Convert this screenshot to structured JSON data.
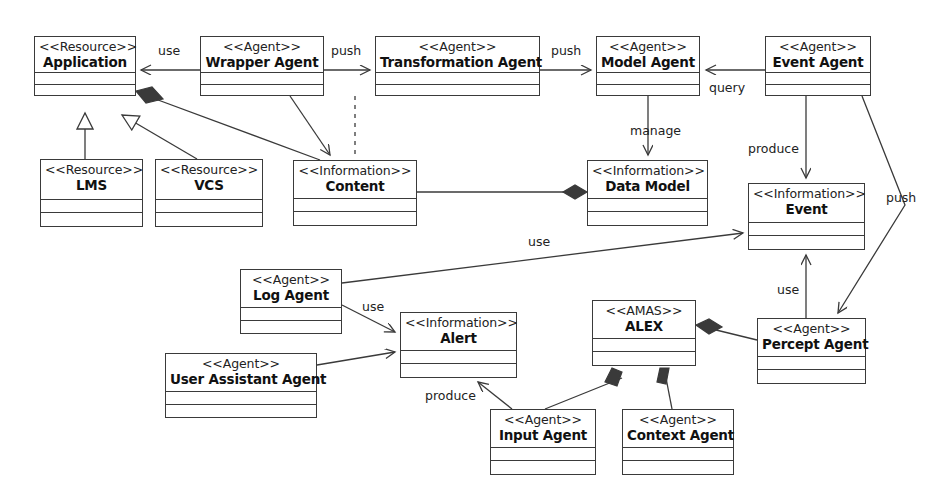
{
  "diagram": {
    "canvas": {
      "width": 942,
      "height": 504
    },
    "line_color": "#3a3a3a",
    "fill_color": "#ffffff",
    "text_color": "#111111"
  },
  "nodes": [
    {
      "id": "application",
      "stereotype": "<<Resource>>",
      "name": "Application",
      "x": 34,
      "y": 36,
      "w": 102,
      "h": 60,
      "header_h": 36,
      "attrs_h": 12
    },
    {
      "id": "wrapper_agent",
      "stereotype": "<<Agent>>",
      "name": "Wrapper Agent",
      "x": 200,
      "y": 36,
      "w": 124,
      "h": 60,
      "header_h": 36,
      "attrs_h": 12
    },
    {
      "id": "transformation",
      "stereotype": "<<Agent>>",
      "name": "Transformation Agent",
      "x": 375,
      "y": 36,
      "w": 165,
      "h": 60,
      "header_h": 36,
      "attrs_h": 12
    },
    {
      "id": "model_agent",
      "stereotype": "<<Agent>>",
      "name": "Model Agent",
      "x": 596,
      "y": 36,
      "w": 104,
      "h": 60,
      "header_h": 36,
      "attrs_h": 12
    },
    {
      "id": "event_agent",
      "stereotype": "<<Agent>>",
      "name": "Event Agent",
      "x": 765,
      "y": 36,
      "w": 106,
      "h": 60,
      "header_h": 36,
      "attrs_h": 12
    },
    {
      "id": "lms",
      "stereotype": "<<Resource>>",
      "name": "LMS",
      "x": 40,
      "y": 159,
      "w": 103,
      "h": 68,
      "header_h": 40,
      "attrs_h": 13
    },
    {
      "id": "vcs",
      "stereotype": "<<Resource>>",
      "name": "VCS",
      "x": 155,
      "y": 159,
      "w": 108,
      "h": 68,
      "header_h": 40,
      "attrs_h": 13
    },
    {
      "id": "content",
      "stereotype": "<<Information>>",
      "name": "Content",
      "x": 293,
      "y": 160,
      "w": 124,
      "h": 66,
      "header_h": 38,
      "attrs_h": 13
    },
    {
      "id": "data_model",
      "stereotype": "<<Information>>",
      "name": "Data Model",
      "x": 587,
      "y": 160,
      "w": 121,
      "h": 66,
      "header_h": 38,
      "attrs_h": 13
    },
    {
      "id": "event",
      "stereotype": "<<Information>>",
      "name": "Event",
      "x": 748,
      "y": 183,
      "w": 117,
      "h": 67,
      "header_h": 39,
      "attrs_h": 13
    },
    {
      "id": "log_agent",
      "stereotype": "<<Agent>>",
      "name": "Log Agent",
      "x": 240,
      "y": 269,
      "w": 102,
      "h": 65,
      "header_h": 38,
      "attrs_h": 13
    },
    {
      "id": "alert",
      "stereotype": "<<Information>>",
      "name": "Alert",
      "x": 400,
      "y": 312,
      "w": 117,
      "h": 66,
      "header_h": 38,
      "attrs_h": 13
    },
    {
      "id": "alex",
      "stereotype": "<<AMAS>>",
      "name": "ALEX",
      "x": 592,
      "y": 300,
      "w": 104,
      "h": 66,
      "header_h": 38,
      "attrs_h": 13
    },
    {
      "id": "percept_agent",
      "stereotype": "<<Agent>>",
      "name": "Percept Agent",
      "x": 757,
      "y": 318,
      "w": 109,
      "h": 66,
      "header_h": 38,
      "attrs_h": 13
    },
    {
      "id": "user_assistant",
      "stereotype": "<<Agent>>",
      "name": "User Assistant Agent",
      "x": 165,
      "y": 353,
      "w": 152,
      "h": 65,
      "header_h": 38,
      "attrs_h": 13
    },
    {
      "id": "input_agent",
      "stereotype": "<<Agent>>",
      "name": "Input Agent",
      "x": 490,
      "y": 409,
      "w": 106,
      "h": 66,
      "header_h": 38,
      "attrs_h": 13
    },
    {
      "id": "context_agent",
      "stereotype": "<<Agent>>",
      "name": "Context Agent",
      "x": 622,
      "y": 409,
      "w": 112,
      "h": 66,
      "header_h": 38,
      "attrs_h": 13
    }
  ],
  "edge_labels": [
    {
      "id": "use_wrapper_app",
      "text": "use",
      "x": 158,
      "y": 43
    },
    {
      "id": "push_wrapper_trans",
      "text": "push",
      "x": 331,
      "y": 43
    },
    {
      "id": "push_trans_model",
      "text": "push",
      "x": 551,
      "y": 43
    },
    {
      "id": "query_event_model",
      "text": "query",
      "x": 709,
      "y": 80
    },
    {
      "id": "manage_model_data",
      "text": "manage",
      "x": 630,
      "y": 123
    },
    {
      "id": "produce_event",
      "text": "produce",
      "x": 748,
      "y": 141
    },
    {
      "id": "push_eventagent_perc",
      "text": "push",
      "x": 886,
      "y": 190
    },
    {
      "id": "use_log_event",
      "text": "use",
      "x": 528,
      "y": 234
    },
    {
      "id": "use_log_alert",
      "text": "use",
      "x": 362,
      "y": 299
    },
    {
      "id": "use_percept_event",
      "text": "use",
      "x": 777,
      "y": 282
    },
    {
      "id": "produce_input_alert",
      "text": "produce",
      "x": 425,
      "y": 388
    }
  ]
}
